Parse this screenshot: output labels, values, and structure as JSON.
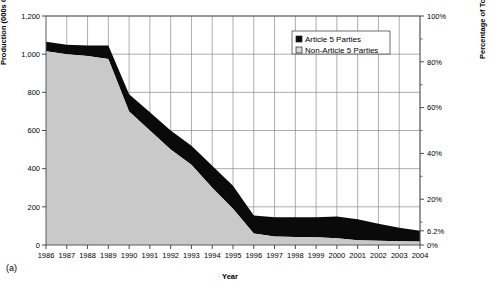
{
  "figure": {
    "panel_label": "(a)"
  },
  "chart_data": {
    "type": "area",
    "stacked": true,
    "title": "",
    "xlabel": "Year",
    "ylabel": "Production (000s ODP tonnes)",
    "y2label": "Percentage of Total Baseline",
    "grid": true,
    "legend_position": "top-right",
    "x": [
      1986,
      1987,
      1988,
      1989,
      1990,
      1991,
      1992,
      1993,
      1994,
      1995,
      1996,
      1997,
      1998,
      1999,
      2000,
      2001,
      2002,
      2003,
      2004
    ],
    "categories": [
      "1986",
      "1987",
      "1988",
      "1989",
      "1990",
      "1991",
      "1992",
      "1993",
      "1994",
      "1995",
      "1996",
      "1997",
      "1998",
      "1999",
      "2000",
      "2001",
      "2002",
      "2003",
      "2004"
    ],
    "ylim": [
      0,
      1200
    ],
    "yticks": [
      0,
      200,
      400,
      600,
      800,
      1000,
      1200
    ],
    "ytick_labels": [
      "0",
      "200",
      "400",
      "600",
      "800",
      "1,000",
      "1,200"
    ],
    "y2lim": [
      0,
      100
    ],
    "y2ticks": [
      0,
      6.2,
      20,
      40,
      60,
      80,
      100
    ],
    "y2tick_labels": [
      "0%",
      "6.2%",
      "20%",
      "40%",
      "60%",
      "80%",
      "100%"
    ],
    "series": [
      {
        "name": "Non-Article 5 Parties",
        "color": "#c9c9c9",
        "values": [
          1015,
          1000,
          990,
          975,
          700,
          600,
          500,
          420,
          300,
          190,
          60,
          45,
          42,
          40,
          35,
          25,
          22,
          20,
          18
        ]
      },
      {
        "name": "Article 5 Parties",
        "color": "#0a0a0a",
        "values": [
          50,
          50,
          55,
          70,
          90,
          95,
          100,
          100,
          115,
          120,
          95,
          100,
          103,
          105,
          115,
          110,
          90,
          70,
          57
        ]
      }
    ],
    "totals": [
      1065,
      1050,
      1045,
      1045,
      790,
      695,
      600,
      520,
      415,
      310,
      155,
      145,
      145,
      145,
      150,
      135,
      112,
      90,
      75
    ]
  },
  "legend": {
    "items": [
      {
        "label": "Article 5 Parties",
        "swatch": "#0a0a0a"
      },
      {
        "label": "Non-Article 5 Parties",
        "swatch": "#d8d8d8"
      }
    ]
  }
}
